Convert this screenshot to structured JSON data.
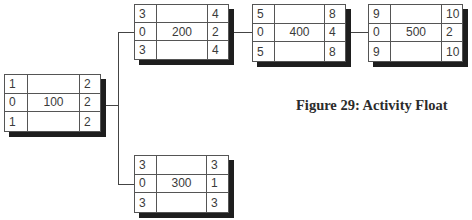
{
  "figure": {
    "caption": "Figure 29: Activity Float"
  },
  "nodes": {
    "a100": {
      "id": "100",
      "top_left": "1",
      "top_right": "2",
      "mid_left": "0",
      "mid_right": "2",
      "bot_left": "1",
      "bot_right": "2"
    },
    "a200": {
      "id": "200",
      "top_left": "3",
      "top_right": "4",
      "mid_left": "0",
      "mid_right": "2",
      "bot_left": "3",
      "bot_right": "4"
    },
    "a300": {
      "id": "300",
      "top_left": "3",
      "top_right": "3",
      "mid_left": "0",
      "mid_right": "1",
      "bot_left": "3",
      "bot_right": "3"
    },
    "a400": {
      "id": "400",
      "top_left": "5",
      "top_right": "8",
      "mid_left": "0",
      "mid_right": "4",
      "bot_left": "5",
      "bot_right": "8"
    },
    "a500": {
      "id": "500",
      "top_left": "9",
      "top_right": "10",
      "mid_left": "0",
      "mid_right": "2",
      "bot_left": "9",
      "bot_right": "10"
    }
  },
  "edges": [
    {
      "from": "100",
      "to": "200"
    },
    {
      "from": "100",
      "to": "300"
    },
    {
      "from": "200",
      "to": "400"
    },
    {
      "from": "400",
      "to": "500"
    }
  ],
  "colors": {
    "border": "#555555",
    "shadow": "#1e1e1e",
    "line": "#444444",
    "text": "#3a3a3a"
  }
}
